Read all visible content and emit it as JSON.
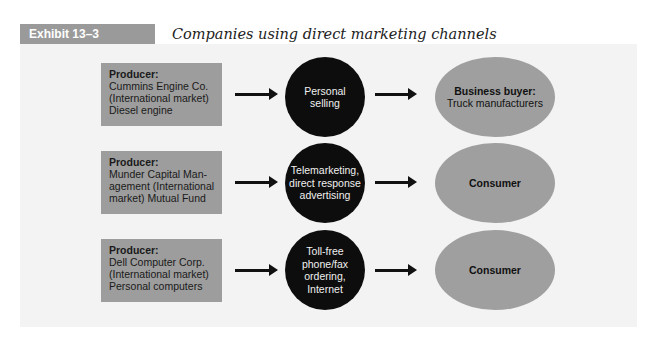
{
  "exhibit": {
    "label": "Exhibit 13–3",
    "title": "Companies using direct marketing channels"
  },
  "rows": [
    {
      "producer": {
        "heading": "Producer:",
        "text": "Cummins Engine Co.\n(International market)\nDiesel engine"
      },
      "channel": "Personal\nselling",
      "buyer": {
        "heading": "Business buyer:",
        "text": "Truck manufacturers"
      }
    },
    {
      "producer": {
        "heading": "Producer:",
        "text": "Munder Capital Man-\nagement (International\nmarket) Mutual Fund"
      },
      "channel": "Telemarketing,\ndirect response\nadvertising",
      "buyer": {
        "heading": "Consumer",
        "text": ""
      }
    },
    {
      "producer": {
        "heading": "Producer:",
        "text": "Dell Computer Corp.\n(International market)\nPersonal computers"
      },
      "channel": "Toll-free\nphone/fax\nordering,\nInternet",
      "buyer": {
        "heading": "Consumer",
        "text": ""
      }
    }
  ],
  "colors": {
    "label_bg": "#9a9a9a",
    "panel_bg": "#f3f3f3",
    "producer_bg": "#9d9d9d",
    "channel_bg": "#0d0d0d",
    "buyer_bg": "#9f9f9f"
  }
}
